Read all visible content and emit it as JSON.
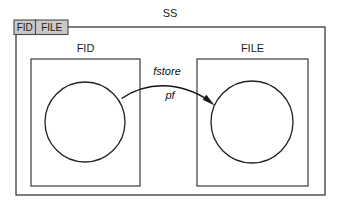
{
  "diagram": {
    "title": "SS",
    "tabs": [
      {
        "label": "FID"
      },
      {
        "label": "FILE"
      }
    ],
    "packages": [
      {
        "name": "FID",
        "label": "FID"
      },
      {
        "name": "FILE",
        "label": "FILE"
      }
    ],
    "edge": {
      "label_top": "fstore",
      "label_bottom": "pf",
      "from": "FID",
      "to": "FILE"
    },
    "colors": {
      "tab_fill": "#c9c9c9",
      "outline": "#3a3a3a",
      "text": "#1b1b1b",
      "edge": "#141414",
      "background": "#ffffff"
    }
  }
}
